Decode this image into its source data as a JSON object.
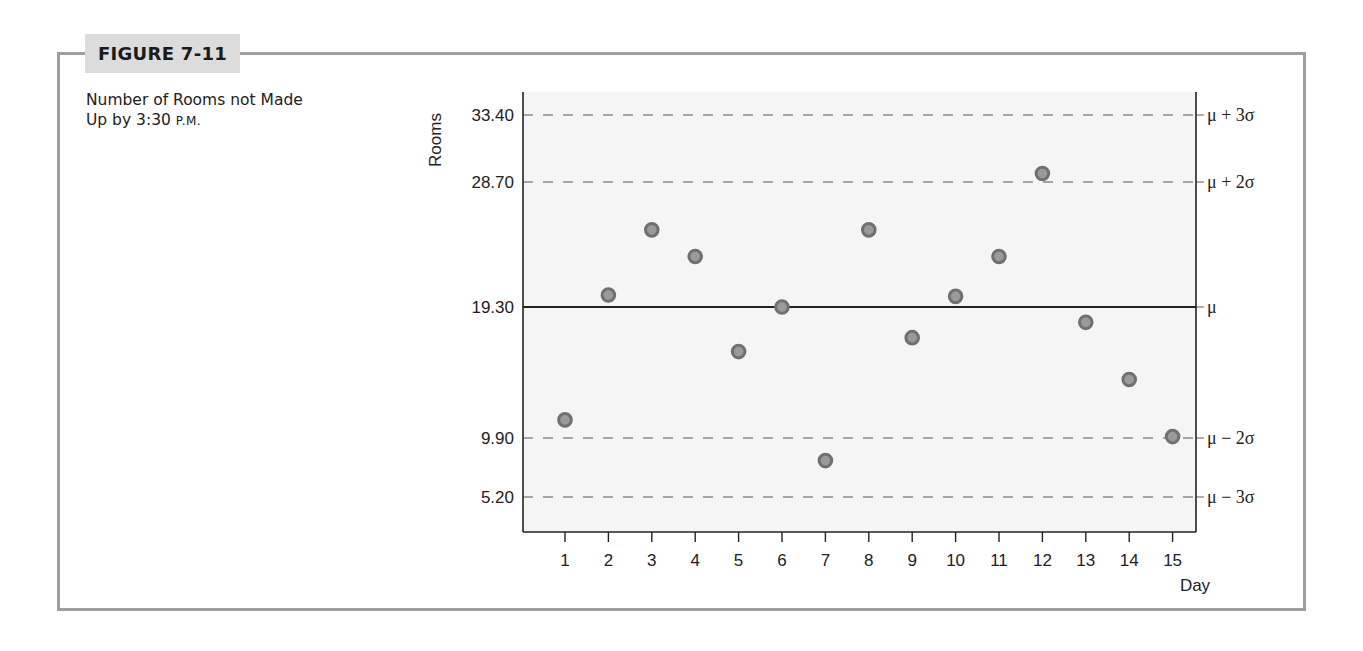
{
  "figure": {
    "tag": "FIGURE 7-11",
    "caption_line1": "Number of Rooms not Made",
    "caption_line2_main": "Up by 3:30 ",
    "caption_line2_smallcaps": "P.M."
  },
  "colors": {
    "frame": "#9e9e9e",
    "tag_bg": "#dcdcdc",
    "plot_bg": "#f5f5f5",
    "axis": "#222222",
    "dashed_limit": "#8a8a8a",
    "point_ring": "#707070",
    "point_fill": "#9a9a9a"
  },
  "chart_data": {
    "type": "scatter",
    "title": "Number of Rooms not Made Up by 3:30 P.M.",
    "xlabel": "Day",
    "ylabel": "Rooms",
    "x": [
      1,
      2,
      3,
      4,
      5,
      6,
      7,
      8,
      9,
      10,
      11,
      12,
      13,
      14,
      15
    ],
    "series": [
      {
        "name": "Rooms not made up",
        "values": [
          11.2,
          20.2,
          25.1,
          23.1,
          16.1,
          19.3,
          8.1,
          25.1,
          17.1,
          20.1,
          23.1,
          29.3,
          18.2,
          14.1,
          10.0
        ]
      }
    ],
    "y_ticks": [
      {
        "value": 33.4,
        "label": "33.40"
      },
      {
        "value": 28.7,
        "label": "28.70"
      },
      {
        "value": 19.3,
        "label": "19.30"
      },
      {
        "value": 9.9,
        "label": "9.90"
      },
      {
        "value": 5.2,
        "label": "5.20"
      }
    ],
    "x_ticks": [
      "1",
      "2",
      "3",
      "4",
      "5",
      "6",
      "7",
      "8",
      "9",
      "10",
      "11",
      "12",
      "13",
      "14",
      "15"
    ],
    "reference_lines": [
      {
        "value": 33.4,
        "label": "μ + 3σ",
        "style": "dashed"
      },
      {
        "value": 28.7,
        "label": "μ + 2σ",
        "style": "dashed"
      },
      {
        "value": 19.3,
        "label": "μ",
        "style": "solid"
      },
      {
        "value": 9.9,
        "label": "μ − 2σ",
        "style": "dashed"
      },
      {
        "value": 5.2,
        "label": "μ − 3σ",
        "style": "dashed"
      }
    ],
    "grid": false,
    "legend": "none"
  }
}
